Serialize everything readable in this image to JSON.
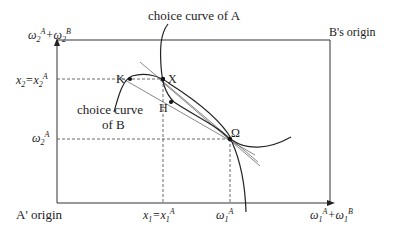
{
  "diagram": {
    "type": "edgeworth-box",
    "labels": {
      "choice_curve_a": "choice curve of A",
      "choice_curve_b_line1": "choice curve",
      "choice_curve_b_line2": "of B",
      "b_origin": "B's origin",
      "a_origin": "A' origin",
      "top_left_axis": "ω2A+ω2B",
      "x2_label": "x2=x2A",
      "omega2a_label": "ω2A",
      "x1_label": "x1=x1A",
      "omega1a_label": "ω1A",
      "bottom_right_axis": "ω1A+ω1B"
    },
    "points": {
      "K": "K",
      "X": "X",
      "H": "H",
      "Omega": "Ω"
    }
  }
}
